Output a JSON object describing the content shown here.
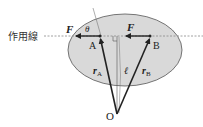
{
  "diagram": {
    "line_of_action_label": "作用線",
    "force_label_left": "F",
    "force_label_right": "F",
    "angle_label": "θ",
    "point_a_label": "A",
    "point_b_label": "B",
    "vector_ra_label": "r",
    "vector_ra_sub": "A",
    "vector_rb_label": "r",
    "vector_rb_sub": "B",
    "arm_label": "ℓ",
    "origin_label": "O",
    "colors": {
      "body_fill": "#d9d9d9",
      "body_stroke": "#555555",
      "line": "#222222",
      "dashed": "#888888"
    }
  }
}
